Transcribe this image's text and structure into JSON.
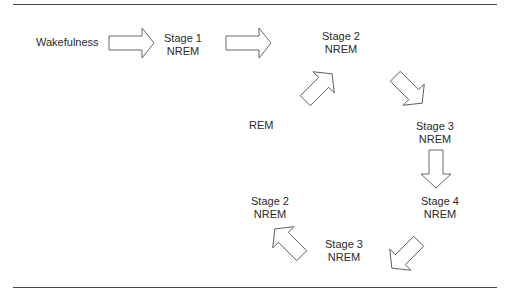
{
  "diagram": {
    "nodes": [
      {
        "id": "wake",
        "line1": "Wakefulness",
        "line2": ""
      },
      {
        "id": "s1",
        "line1": "Stage 1",
        "line2": "NREM"
      },
      {
        "id": "s2a",
        "line1": "Stage 2",
        "line2": "NREM"
      },
      {
        "id": "s3a",
        "line1": "Stage 3",
        "line2": "NREM"
      },
      {
        "id": "s4",
        "line1": "Stage 4",
        "line2": "NREM"
      },
      {
        "id": "s3b",
        "line1": "Stage 3",
        "line2": "NREM"
      },
      {
        "id": "s2b",
        "line1": "Stage 2",
        "line2": "NREM"
      },
      {
        "id": "rem",
        "line1": "REM",
        "line2": ""
      }
    ],
    "edges": [
      {
        "from": "wake",
        "to": "s1"
      },
      {
        "from": "s1",
        "to": "s2a"
      },
      {
        "from": "s2a",
        "to": "s3a"
      },
      {
        "from": "s3a",
        "to": "s4"
      },
      {
        "from": "s4",
        "to": "s3b"
      },
      {
        "from": "s3b",
        "to": "s2b"
      },
      {
        "from": "rem",
        "to": "s2a"
      }
    ]
  }
}
